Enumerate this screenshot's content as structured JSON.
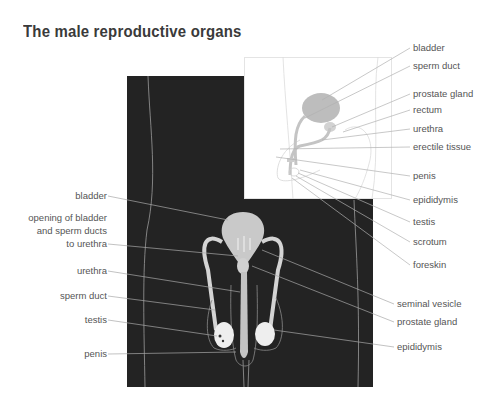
{
  "title": "The male reproductive organs",
  "colors": {
    "panel_dark": "#232323",
    "organ_fill": "#c8c8c8",
    "inset_organ_fill": "#bdbdbd",
    "leader_line": "#aaaaaa",
    "label_text": "#555555",
    "title_text": "#3a3a3a"
  },
  "side_view_labels": [
    {
      "id": "bladder",
      "text": "bladder"
    },
    {
      "id": "sperm-duct",
      "text": "sperm duct"
    },
    {
      "id": "prostate-gland",
      "text": "prostate gland"
    },
    {
      "id": "rectum",
      "text": "rectum"
    },
    {
      "id": "urethra",
      "text": "urethra"
    },
    {
      "id": "erectile-tissue",
      "text": "erectile tissue"
    },
    {
      "id": "penis",
      "text": "penis"
    },
    {
      "id": "epididymis",
      "text": "epididymis"
    },
    {
      "id": "testis",
      "text": "testis"
    },
    {
      "id": "scrotum",
      "text": "scrotum"
    },
    {
      "id": "foreskin",
      "text": "foreskin"
    }
  ],
  "front_view_left_labels": [
    {
      "id": "bladder",
      "text": "bladder"
    },
    {
      "id": "opening",
      "lines": [
        "opening of bladder",
        "and sperm ducts",
        "to urethra"
      ]
    },
    {
      "id": "urethra",
      "text": "urethra"
    },
    {
      "id": "sperm-duct",
      "text": "sperm duct"
    },
    {
      "id": "testis",
      "text": "testis"
    },
    {
      "id": "penis",
      "text": "penis"
    }
  ],
  "front_view_right_labels": [
    {
      "id": "seminal-vesicle",
      "text": "seminal vesicle"
    },
    {
      "id": "prostate-gland",
      "text": "prostate gland"
    },
    {
      "id": "epididymis",
      "text": "epididymis"
    }
  ]
}
